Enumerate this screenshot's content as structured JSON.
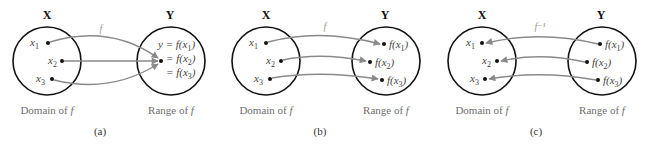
{
  "colors": {
    "background": "#ffffff",
    "circle_stroke": "#111111",
    "arrow_stroke": "#8a8a8a",
    "caption_text": "#6f6f6f"
  },
  "panels": [
    {
      "id": "a",
      "label": "(a)",
      "domain_title": "X",
      "range_title": "Y",
      "function_label": "f",
      "domain_caption": "Domain of f",
      "range_caption": "Range of f",
      "domain_elements": [
        "x1",
        "x2",
        "x3"
      ],
      "range_elements": [
        "y = f(x1)",
        "= f(x2)",
        "= f(x3)"
      ],
      "mapping": "many-to-one"
    },
    {
      "id": "b",
      "label": "(b)",
      "domain_title": "X",
      "range_title": "Y",
      "function_label": "f",
      "domain_caption": "Domain of f",
      "range_caption": "Range of f",
      "domain_elements": [
        "x1",
        "x2",
        "x3"
      ],
      "range_elements": [
        "f(x1)",
        "f(x2)",
        "f(x3)"
      ],
      "mapping": "one-to-one"
    },
    {
      "id": "c",
      "label": "(c)",
      "domain_title": "X",
      "range_title": "Y",
      "function_label": "f⁻¹",
      "domain_caption": "Domain of f",
      "range_caption": "Range of f",
      "domain_elements": [
        "x1",
        "x2",
        "x3"
      ],
      "range_elements": [
        "f(x1)",
        "f(x2)",
        "f(x3)"
      ],
      "mapping": "inverse"
    }
  ]
}
